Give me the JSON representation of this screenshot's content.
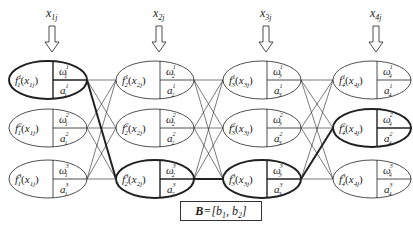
{
  "diagram": {
    "columns": [
      {
        "input_label": "x",
        "input_sub": "1j",
        "func_sub": "1",
        "x_arg": "x",
        "x_arg_sub": "1j"
      },
      {
        "input_label": "x",
        "input_sub": "2j",
        "func_sub": "2",
        "x_arg": "x",
        "x_arg_sub": "2j"
      },
      {
        "input_label": "x",
        "input_sub": "3j",
        "func_sub": "3",
        "x_arg": "x",
        "x_arg_sub": "3j"
      },
      {
        "input_label": "x",
        "input_sub": "4j",
        "func_sub": "4",
        "x_arg": "x",
        "x_arg_sub": "4j"
      }
    ],
    "rows": [
      "1",
      "2",
      "3"
    ],
    "node_labels": {
      "function": "f",
      "weight": "ω",
      "param": "a"
    },
    "highlighted_path": [
      {
        "column": 1,
        "row": 1
      },
      {
        "column": 2,
        "row": 3
      },
      {
        "column": 3,
        "row": 3
      },
      {
        "column": 4,
        "row": 2
      }
    ],
    "bottom_box": {
      "lhs": "B",
      "rhs": "=[b",
      "sub1": "1",
      "mid": ", b",
      "sub2": "2",
      "end": "]"
    },
    "colors": {
      "stroke": "#222222",
      "background": "#ffffff"
    }
  }
}
